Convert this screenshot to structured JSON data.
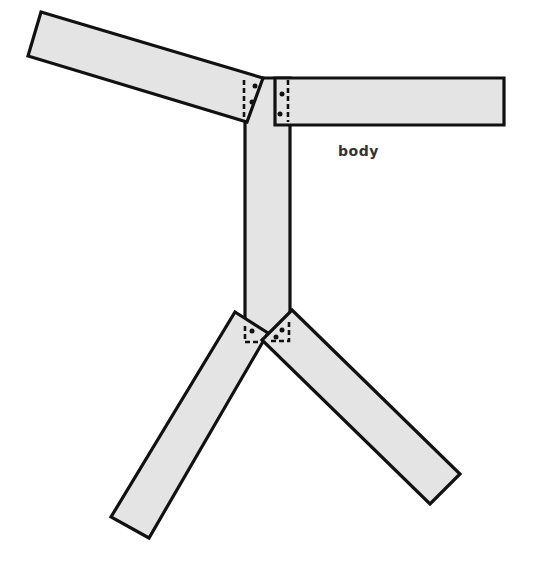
{
  "diagram": {
    "label": "body",
    "label_position": {
      "x": 338,
      "y": 143
    },
    "colors": {
      "fill": "#e4e4e4",
      "stroke": "#111111",
      "label": "#333333"
    },
    "parts": [
      {
        "name": "left-arm",
        "type": "rectangle",
        "rotation_deg": 17
      },
      {
        "name": "right-arm",
        "type": "rectangle",
        "rotation_deg": 0
      },
      {
        "name": "torso",
        "type": "rectangle",
        "rotation_deg": 90
      },
      {
        "name": "left-leg",
        "type": "rectangle",
        "rotation_deg": -60
      },
      {
        "name": "right-leg",
        "type": "rectangle",
        "rotation_deg": 44
      }
    ],
    "joints": [
      {
        "name": "left-shoulder-joint",
        "style": "dashed",
        "dots": 2
      },
      {
        "name": "right-shoulder-joint",
        "style": "dashed",
        "dots": 2
      },
      {
        "name": "left-hip-joint",
        "style": "dashed",
        "dots": 1
      },
      {
        "name": "right-hip-joint",
        "style": "dashed",
        "dots": 2
      }
    ]
  }
}
